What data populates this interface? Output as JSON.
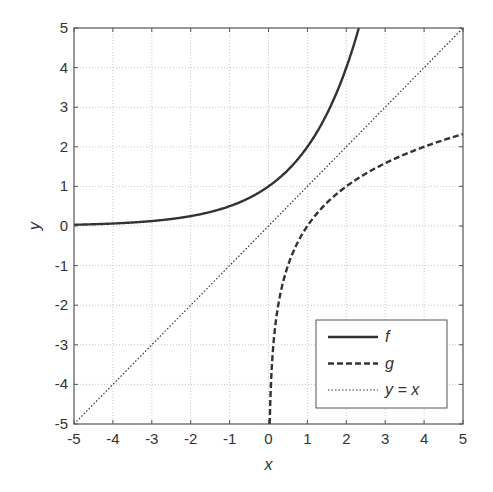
{
  "chart_data": {
    "type": "line",
    "title": "",
    "xlabel": "x",
    "ylabel": "y",
    "xlim": [
      -5,
      5
    ],
    "ylim": [
      -5,
      5
    ],
    "x_ticks": [
      -5,
      -4,
      -3,
      -2,
      -1,
      0,
      1,
      2,
      3,
      4,
      5
    ],
    "y_ticks": [
      -5,
      -4,
      -3,
      -2,
      -1,
      0,
      1,
      2,
      3,
      4,
      5
    ],
    "grid": true,
    "legend_position": "lower right",
    "series": [
      {
        "name": "f",
        "style": "solid",
        "function": "2^x",
        "x": [
          -5,
          -4,
          -3,
          -2,
          -1,
          0,
          1,
          2,
          2.32
        ],
        "y": [
          0.03,
          0.06,
          0.13,
          0.25,
          0.5,
          1,
          2,
          4,
          5
        ]
      },
      {
        "name": "g",
        "style": "dashed",
        "function": "log2(x)",
        "x": [
          0.03125,
          0.0625,
          0.125,
          0.25,
          0.5,
          1,
          2,
          3,
          4,
          5
        ],
        "y": [
          -5,
          -4,
          -3,
          -2,
          -1,
          0,
          1,
          1.58,
          2,
          2.32
        ]
      },
      {
        "name": "y = x",
        "style": "dotted",
        "function": "x",
        "x": [
          -5,
          5
        ],
        "y": [
          -5,
          5
        ]
      }
    ]
  },
  "legend": {
    "items": [
      {
        "label": "f",
        "style": "solid"
      },
      {
        "label": "g",
        "style": "dashed"
      },
      {
        "label": "y = x",
        "style": "dotted"
      }
    ]
  },
  "colors": {
    "line": "#333333",
    "grid": "#c8c8c8",
    "axis": "#555555"
  }
}
